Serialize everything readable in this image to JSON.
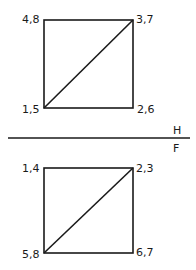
{
  "top_view": {
    "square": {
      "x": 44,
      "y": 20,
      "w": 89,
      "h": 88
    },
    "labels": {
      "top_left": "4,8",
      "top_right": "3,7",
      "bottom_left": "1,5",
      "bottom_right": "2,6"
    }
  },
  "divider": {
    "upper_label": "H",
    "lower_label": "F"
  },
  "front_view": {
    "square": {
      "x": 44,
      "y": 168,
      "w": 89,
      "h": 85
    },
    "labels": {
      "top_left": "1,4",
      "top_right": "2,3",
      "bottom_left": "5,8",
      "bottom_right": "6,7"
    }
  },
  "colors": {
    "line": "#1a1a1a",
    "background": "#ffffff"
  }
}
